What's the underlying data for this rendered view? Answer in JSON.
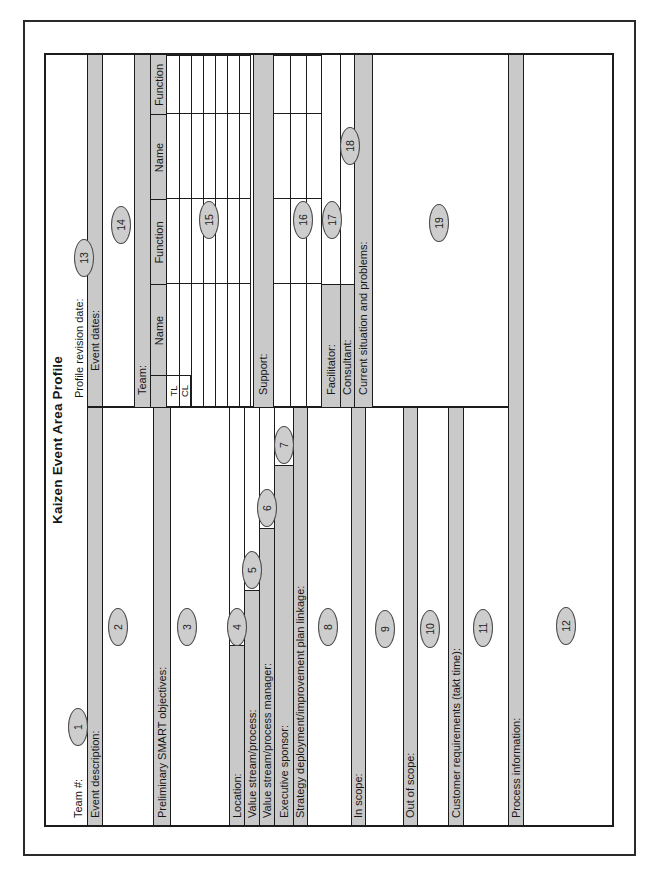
{
  "form": {
    "title": "Kaizen Event Area Profile",
    "left": {
      "team_no": "Team #:",
      "event_description": "Event description:",
      "smart_objectives": "Preliminary SMART objectives:",
      "location": "Location:",
      "value_stream": "Value stream/process:",
      "value_stream_manager": "Value stream/process manager:",
      "executive_sponsor": "Executive sponsor:",
      "strategy_linkage": "Strategy deployment/improvement plan linkage:",
      "in_scope": "In scope:",
      "out_of_scope": "Out of scope:",
      "customer_requirements": "Customer requirements (takt time):",
      "process_information": "Process information:"
    },
    "right": {
      "profile_revision_date": "Profile revision date:",
      "event_dates": "Event dates:",
      "team": "Team:",
      "support": "Support:",
      "facilitator": "Facilitator:",
      "consultant": "Consultant:",
      "current_situation": "Current situation and problems:",
      "col_name": "Name",
      "col_function": "Function",
      "row_tl": "TL",
      "row_cl": "CL"
    },
    "callouts": [
      "1",
      "2",
      "3",
      "4",
      "5",
      "6",
      "7",
      "8",
      "9",
      "10",
      "11",
      "12",
      "13",
      "14",
      "15",
      "16",
      "17",
      "18",
      "19"
    ],
    "colors": {
      "shade": "#c9c9c9",
      "line": "#1c1c1c",
      "oval_fill": "#cdcdcd",
      "oval_stroke": "#4a4a4a"
    }
  }
}
